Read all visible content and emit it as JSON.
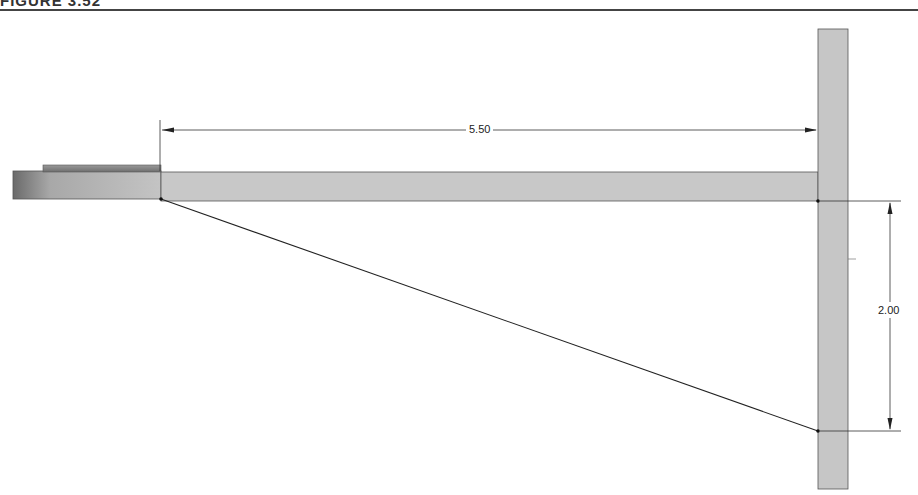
{
  "figure": {
    "title": "FIGURE 3.52"
  },
  "dimensions": {
    "horizontal": {
      "label": "5.50"
    },
    "vertical": {
      "label": "2.00"
    }
  },
  "colors": {
    "part_fill": "#c8c8c8",
    "part_stroke": "#555555",
    "line": "#222222"
  }
}
